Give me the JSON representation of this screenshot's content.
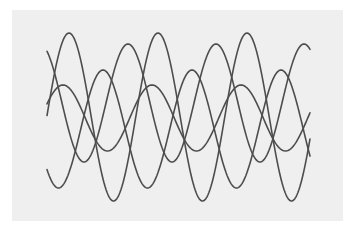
{
  "figure": {
    "background": "#ffffff",
    "panel_color": "#efefef",
    "stroke_color": "#4d4d4d",
    "stroke_width": 1.6,
    "x_start": 47,
    "x_end": 310
  },
  "waves": [
    {
      "name": "wave-1",
      "center_y": 117,
      "amplitude": 84,
      "period": 89,
      "peak_x": 69
    },
    {
      "name": "wave-2",
      "center_y": 103,
      "amplitude": 59,
      "period": 88,
      "peak_x": 128
    },
    {
      "name": "wave-3",
      "center_y": 129,
      "amplitude": 59,
      "period": 89,
      "peak_x": 103
    },
    {
      "name": "wave-4",
      "center_y": 118,
      "amplitude": 33,
      "period": 89,
      "peak_x": 63
    }
  ]
}
